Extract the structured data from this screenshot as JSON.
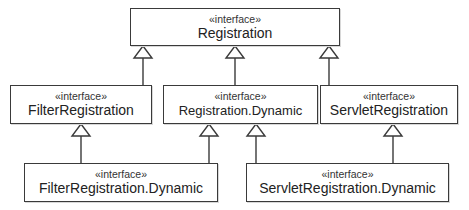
{
  "diagram": {
    "type": "uml-class-diagram",
    "colors": {
      "line": "#3a3a3a",
      "fill": "#ffffff",
      "text": "#222222"
    },
    "nodes": [
      {
        "id": "registration",
        "stereotype": "«interface»",
        "name": "Registration"
      },
      {
        "id": "filter_registration",
        "stereotype": "«interface»",
        "name": "FilterRegistration"
      },
      {
        "id": "registration_dynamic",
        "stereotype": "«interface»",
        "name": "Registration.Dynamic"
      },
      {
        "id": "servlet_registration",
        "stereotype": "«interface»",
        "name": "ServletRegistration"
      },
      {
        "id": "filter_registration_dynamic",
        "stereotype": "«interface»",
        "name": "FilterRegistration.Dynamic"
      },
      {
        "id": "servlet_registration_dynamic",
        "stereotype": "«interface»",
        "name": "ServletRegistration.Dynamic"
      }
    ],
    "edges": [
      {
        "from": "filter_registration",
        "to": "registration",
        "type": "generalization"
      },
      {
        "from": "registration_dynamic",
        "to": "registration",
        "type": "generalization"
      },
      {
        "from": "servlet_registration",
        "to": "registration",
        "type": "generalization"
      },
      {
        "from": "filter_registration_dynamic",
        "to": "filter_registration",
        "type": "generalization"
      },
      {
        "from": "filter_registration_dynamic",
        "to": "registration_dynamic",
        "type": "generalization"
      },
      {
        "from": "servlet_registration_dynamic",
        "to": "registration_dynamic",
        "type": "generalization"
      },
      {
        "from": "servlet_registration_dynamic",
        "to": "servlet_registration",
        "type": "generalization"
      }
    ]
  }
}
